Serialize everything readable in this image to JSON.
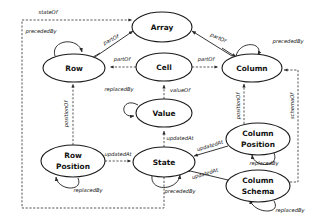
{
  "diagram": {
    "type": "directed-graph",
    "background_color": "#ffffff",
    "node_fill": "#ffffff",
    "node_stroke": "#1a1a1a",
    "edge_color": "#3a3a3a",
    "label_color": "#111111"
  },
  "nodes": [
    {
      "id": "array",
      "label": "Array",
      "label2": "",
      "cx": 162,
      "cy": 27,
      "rx": 30,
      "ry": 15
    },
    {
      "id": "row",
      "label": "Row",
      "label2": "",
      "cx": 74,
      "cy": 68,
      "rx": 31,
      "ry": 14
    },
    {
      "id": "cell",
      "label": "Cell",
      "label2": "",
      "cx": 164,
      "cy": 67,
      "rx": 28,
      "ry": 14
    },
    {
      "id": "column",
      "label": "Column",
      "label2": "",
      "cx": 252,
      "cy": 68,
      "rx": 30,
      "ry": 14
    },
    {
      "id": "value",
      "label": "Value",
      "label2": "",
      "cx": 164,
      "cy": 113,
      "rx": 28,
      "ry": 14
    },
    {
      "id": "state",
      "label": "State",
      "label2": "",
      "cx": 164,
      "cy": 162,
      "rx": 31,
      "ry": 15
    },
    {
      "id": "row-position",
      "label": "Row",
      "label2": "Position",
      "cx": 73,
      "cy": 161,
      "rx": 32,
      "ry": 16
    },
    {
      "id": "column-position",
      "label": "Column",
      "label2": "Position",
      "cx": 258,
      "cy": 139,
      "rx": 32,
      "ry": 16
    },
    {
      "id": "column-schema",
      "label": "Column",
      "label2": "Schema",
      "cx": 258,
      "cy": 186,
      "rx": 32,
      "ry": 16
    }
  ],
  "edges": [
    {
      "id": "e-state-array",
      "from": "state",
      "to": "array",
      "label": "stateOf"
    },
    {
      "id": "e-row-array",
      "from": "row",
      "to": "array",
      "label": "partOf"
    },
    {
      "id": "e-column-array",
      "from": "column",
      "to": "array",
      "label": "partOf"
    },
    {
      "id": "e-cell-row",
      "from": "cell",
      "to": "row",
      "label": "partOf"
    },
    {
      "id": "e-cell-column",
      "from": "cell",
      "to": "column",
      "label": "partOf"
    },
    {
      "id": "e-row-row",
      "from": "row",
      "to": "row",
      "label": "precededBy"
    },
    {
      "id": "e-column-column",
      "from": "column",
      "to": "column",
      "label": "precededBy"
    },
    {
      "id": "e-value-cell",
      "from": "value",
      "to": "cell",
      "label": "valueOf"
    },
    {
      "id": "e-value-value",
      "from": "value",
      "to": "value",
      "label": "replacedBy"
    },
    {
      "id": "e-state-value",
      "from": "state",
      "to": "value",
      "label": "updatedAt"
    },
    {
      "id": "e-rowpos-row",
      "from": "row-position",
      "to": "row",
      "label": "positionOf"
    },
    {
      "id": "e-rowpos-state",
      "from": "row-position",
      "to": "state",
      "label": "updatedAt"
    },
    {
      "id": "e-rowpos-rowpos",
      "from": "row-position",
      "to": "row-position",
      "label": "replacedBy"
    },
    {
      "id": "e-colpos-column",
      "from": "column-position",
      "to": "column",
      "label": "positionOf"
    },
    {
      "id": "e-colpos-state",
      "from": "column-position",
      "to": "state",
      "label": "updatedAt"
    },
    {
      "id": "e-colpos-colpos",
      "from": "column-position",
      "to": "column-position",
      "label": "replacedBy"
    },
    {
      "id": "e-colschema-column",
      "from": "column-schema",
      "to": "column",
      "label": "schemaOf"
    },
    {
      "id": "e-colschema-state",
      "from": "column-schema",
      "to": "state",
      "label": "updatedAt"
    },
    {
      "id": "e-colschema-schema",
      "from": "column-schema",
      "to": "column-schema",
      "label": "replacedBy"
    },
    {
      "id": "e-state-state",
      "from": "state",
      "to": "state",
      "label": "precededBy"
    }
  ],
  "edge_labels": {
    "state_of": "stateOf",
    "part_of": "partOf",
    "preceded_by": "precededBy",
    "value_of": "valueOf",
    "replaced_by": "replacedBy",
    "updated_at": "updatedAt",
    "position_of": "positionOf",
    "schema_of": "schemaOf"
  },
  "labels": {
    "stateOf_top": "stateOf",
    "precededBy_row": "precededBy",
    "partOf_row_array": "partOf",
    "partOf_column_array": "partOf",
    "precededBy_column": "precededBy",
    "partOf_cell_row": "partOf",
    "partOf_cell_column": "partOf",
    "replacedBy_value": "replacedBy",
    "valueOf": "valueOf",
    "positionOf_row": "positionOf",
    "positionOf_column": "positionOf",
    "schemaOf": "schemaOf",
    "updatedAt_value": "updatedAt",
    "updatedAt_rowpos": "updatedAt",
    "updatedAt_colpos": "updatedAt",
    "updatedAt_colschema": "updatedAt",
    "replacedBy_rowpos": "replacedBy",
    "replacedBy_colpos": "replacedBy",
    "replacedBy_colschema": "replacedBy",
    "precededBy_state": "precededBy"
  }
}
